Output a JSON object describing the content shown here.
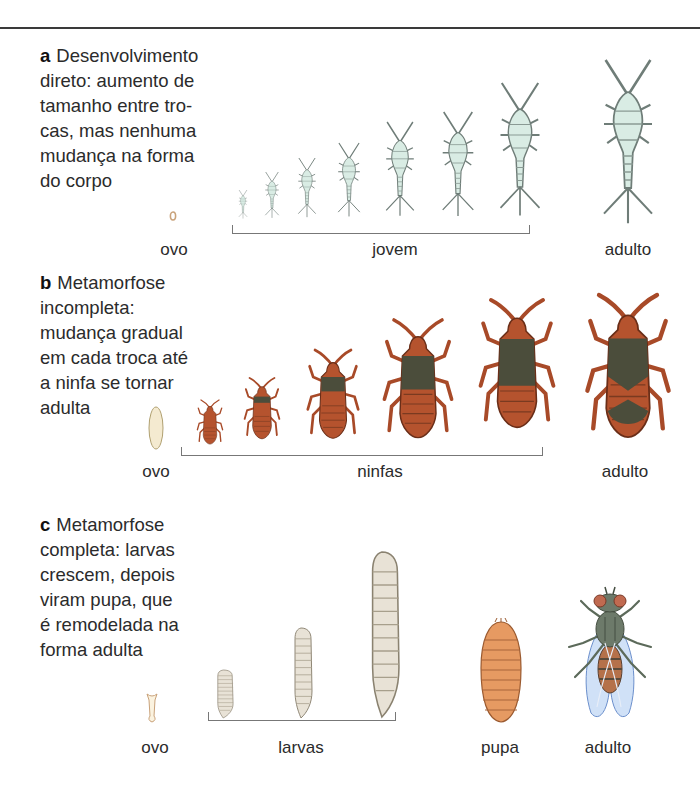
{
  "panels": [
    {
      "id": "a",
      "letter": "a",
      "caption_lines": [
        "Desenvolvimento",
        "direto: aumento de",
        "tamanho entre tro-",
        "cas, mas nenhuma",
        "mudança na forma",
        "do corpo"
      ],
      "labels": {
        "egg": "ovo",
        "group": "jovem",
        "adult": "adulto"
      },
      "group_count": 7,
      "colors": {
        "body": "#d9ece4",
        "outline": "#6f7d78",
        "egg": "#c9a27a"
      }
    },
    {
      "id": "b",
      "letter": "b",
      "caption_lines": [
        "Metamorfose",
        "incompleta:",
        "mudança gradual",
        "em cada troca até",
        "a ninfa se tornar",
        "adulta"
      ],
      "labels": {
        "egg": "ovo",
        "group": "ninfas",
        "adult": "adulto"
      },
      "group_count": 5,
      "colors": {
        "body": "#b5532e",
        "wing": "#4b4d3b",
        "egg": "#f4ead0"
      }
    },
    {
      "id": "c",
      "letter": "c",
      "caption_lines": [
        "Metamorfose",
        "completa: larvas",
        "crescem, depois",
        "viram pupa, que",
        "é remodelada na",
        "forma adulta"
      ],
      "labels": {
        "egg": "ovo",
        "group": "larvas",
        "pupa": "pupa",
        "adult": "adulto"
      },
      "group_count": 3,
      "colors": {
        "larva": "#e8e2d6",
        "pupa": "#e69a62",
        "fly_body": "#6d7a6a",
        "fly_eye": "#c06a50",
        "wing": "#a9c8f0"
      }
    }
  ]
}
